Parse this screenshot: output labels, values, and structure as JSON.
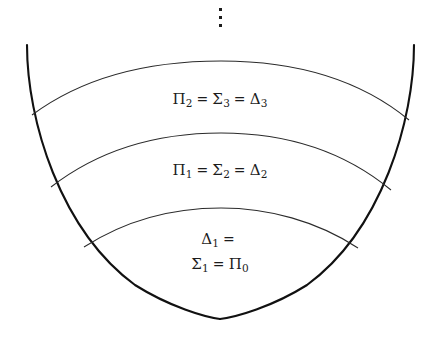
{
  "figure": {
    "background_color": "#ffffff",
    "outline_color": "#111111",
    "arc_color": "#2b2b2b",
    "text_color": "#1c1c1c",
    "continuation_marker": "vertical-dots"
  },
  "bands": [
    {
      "id": "band-top",
      "label_full": "Π₂ = Σ₃ = Δ₃",
      "terms": [
        {
          "symbol": "Π",
          "index": "2"
        },
        {
          "symbol": "Σ",
          "index": "3"
        },
        {
          "symbol": "Δ",
          "index": "3"
        }
      ],
      "relation": "="
    },
    {
      "id": "band-middle",
      "label_full": "Π₁ = Σ₂ = Δ₂",
      "terms": [
        {
          "symbol": "Π",
          "index": "1"
        },
        {
          "symbol": "Σ",
          "index": "2"
        },
        {
          "symbol": "Δ",
          "index": "2"
        }
      ],
      "relation": "="
    },
    {
      "id": "band-bottom",
      "label_line1": "Δ₁ =",
      "label_line2": "Σ₁ = Π₀",
      "terms": [
        {
          "symbol": "Δ",
          "index": "1"
        },
        {
          "symbol": "Σ",
          "index": "1"
        },
        {
          "symbol": "Π",
          "index": "0"
        }
      ],
      "relation": "="
    }
  ],
  "glyphs": {
    "pi": "Π",
    "sigma": "Σ",
    "delta": "Δ",
    "equals": "=",
    "vdots": "⋮"
  },
  "geometry": {
    "cusp_x": 220,
    "cusp_y": 319,
    "left_top_x": 27,
    "right_top_x": 414,
    "top_y": 45,
    "arc_apex_y": [
      61,
      133,
      208
    ],
    "arc_left_y": [
      115,
      187,
      247
    ],
    "arc_right_y": [
      120,
      190,
      248
    ]
  }
}
